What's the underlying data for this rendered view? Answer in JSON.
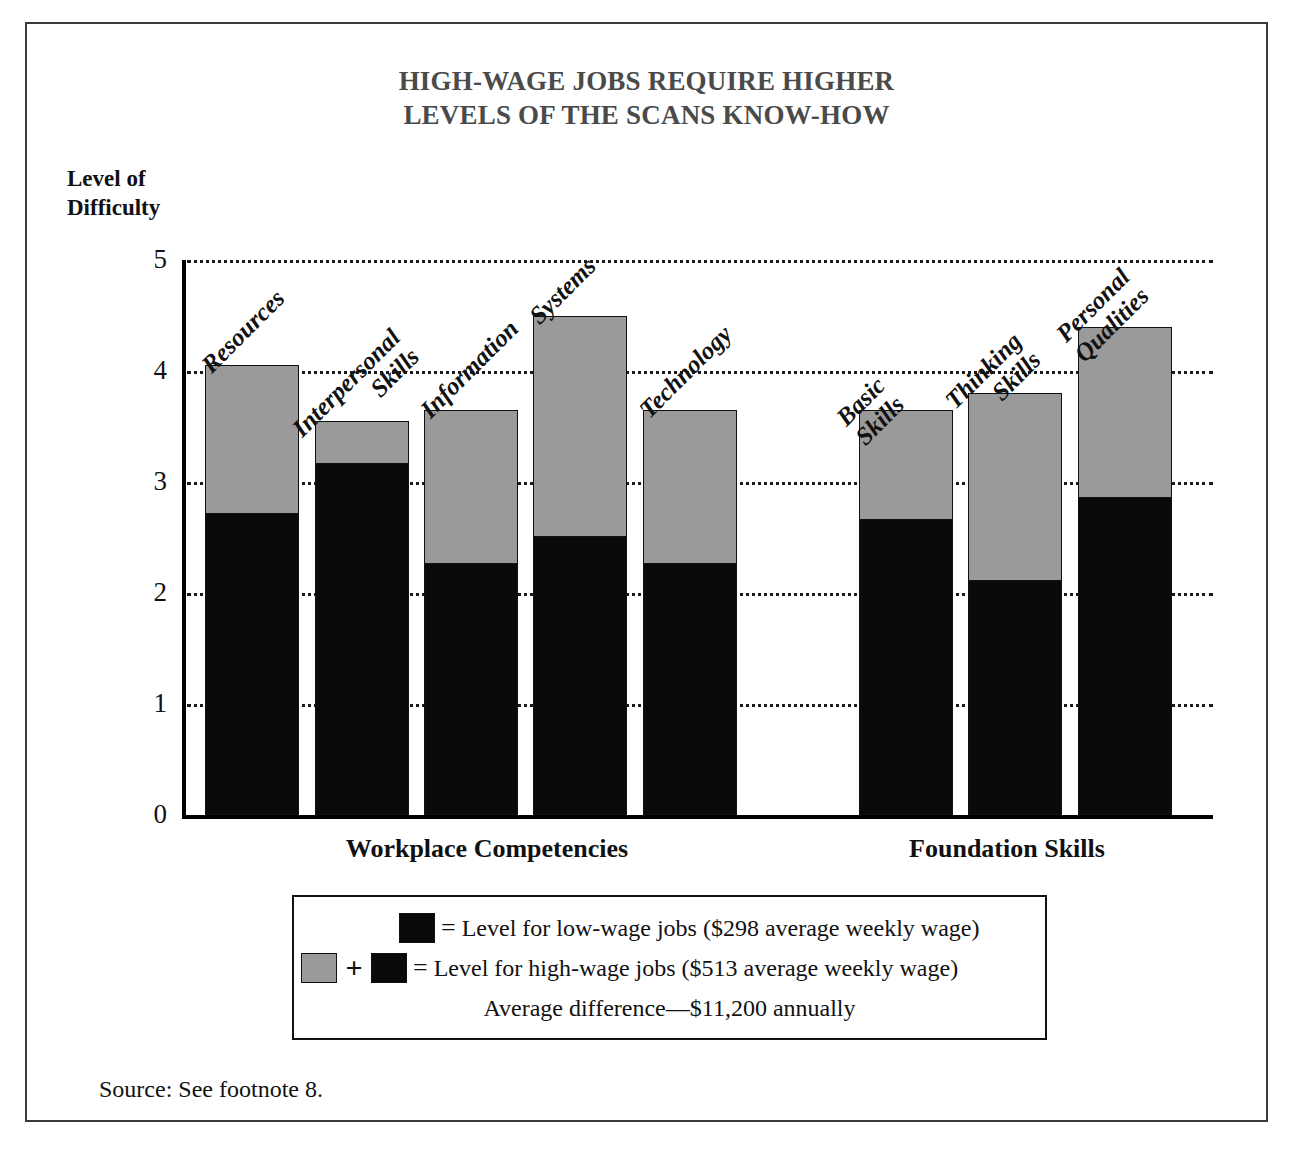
{
  "title": {
    "line1": "HIGH-WAGE JOBS REQUIRE HIGHER",
    "line2": "LEVELS OF THE SCANS KNOW-HOW"
  },
  "axis": {
    "y_label_line1": "Level of",
    "y_label_line2": "Difficulty",
    "y_ticks": [
      "5",
      "4",
      "3",
      "2",
      "1",
      "0"
    ]
  },
  "groups": [
    {
      "label": "Workplace Competencies"
    },
    {
      "label": "Foundation Skills"
    }
  ],
  "legend": {
    "row1_eq": "=",
    "row1_text": "Level for low-wage jobs  ($298 average weekly wage)",
    "row2_plus": "+",
    "row2_eq": "=",
    "row2_text": "Level for high-wage jobs  ($513 average weekly wage)",
    "row3_text": "Average difference—$11,200 annually"
  },
  "source": "Source: See footnote 8.",
  "colors": {
    "low_wage": "#0a0a0a",
    "high_wage_increment": "#9a9a9a",
    "title": "#4a4a4a",
    "frame": "#3a3a3a"
  },
  "chart_data": {
    "type": "bar",
    "title": "HIGH-WAGE JOBS REQUIRE HIGHER LEVELS OF THE SCANS KNOW-HOW",
    "xlabel": "",
    "ylabel": "Level of Difficulty",
    "ylim": [
      0,
      5
    ],
    "ytick_values": [
      0,
      1,
      2,
      3,
      4,
      5
    ],
    "grid": true,
    "grid_axis": "y",
    "stacked": true,
    "legend_position": "below-plot",
    "categories": [
      "Resources",
      "Interpersonal Skills",
      "Information",
      "Systems",
      "Technology",
      "Basic Skills",
      "Thinking Skills",
      "Personal Qualities"
    ],
    "category_groups": [
      "Workplace Competencies",
      "Workplace Competencies",
      "Workplace Competencies",
      "Workplace Competencies",
      "Workplace Competencies",
      "Foundation Skills",
      "Foundation Skills",
      "Foundation Skills"
    ],
    "series": [
      {
        "name": "Level for low-wage jobs ($298 average weekly wage)",
        "color": "#0a0a0a",
        "values": [
          2.7,
          3.15,
          2.25,
          2.5,
          2.25,
          2.65,
          2.1,
          2.85
        ]
      },
      {
        "name": "Level for high-wage jobs ($513 average weekly wage)",
        "color": "#9a9a9a",
        "note": "Gray segment is the increment above low-wage; total bar height is the high-wage level.",
        "totals": [
          4.05,
          3.55,
          3.65,
          4.5,
          3.65,
          3.65,
          3.8,
          4.4
        ],
        "increments": [
          1.35,
          0.4,
          1.4,
          2.0,
          1.4,
          1.0,
          1.7,
          1.55
        ]
      }
    ],
    "annotations": [
      "Average difference—$11,200 annually"
    ]
  }
}
